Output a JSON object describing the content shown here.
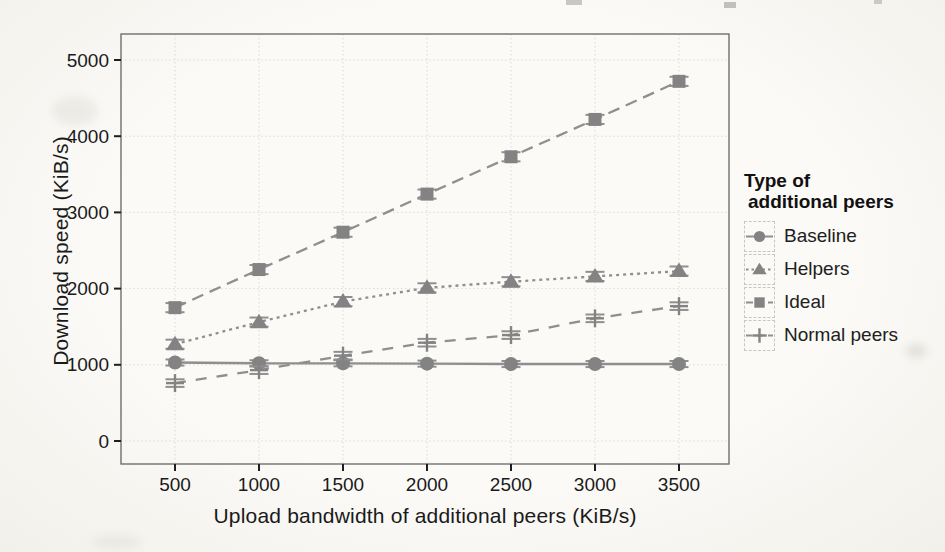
{
  "colors": {
    "paper": "#faf9f6",
    "series": "#8f8f8f",
    "marker": "#838383",
    "grid": "#dcdad4",
    "panel_border": "#6f6f6f",
    "tick": "#1f1f1f",
    "text": "#1a1a1a"
  },
  "chart_data": {
    "type": "line",
    "title": "",
    "xlabel": "Upload bandwidth of additional peers (KiB/s)",
    "ylabel": "Download speed (KiB/s)",
    "x": [
      500,
      1000,
      1500,
      2000,
      2500,
      3000,
      3500
    ],
    "xticks": [
      500,
      1000,
      1500,
      2000,
      2500,
      3000,
      3500
    ],
    "yticks": [
      0,
      1000,
      2000,
      3000,
      4000,
      5000
    ],
    "xlim": [
      180,
      3820
    ],
    "ylim": [
      -360,
      5340
    ],
    "grid": "dotted-major",
    "legend_position": "right",
    "legend_title": [
      "Type of",
      "additional peers"
    ],
    "series": [
      {
        "name": "Baseline",
        "marker": "circle",
        "linestyle": "solid",
        "values": [
          1030,
          1020,
          1020,
          1015,
          1010,
          1010,
          1010
        ],
        "error": 40
      },
      {
        "name": "Helpers",
        "marker": "triangle",
        "linestyle": "dotted",
        "values": [
          1270,
          1560,
          1830,
          2010,
          2090,
          2160,
          2230
        ],
        "error": 60
      },
      {
        "name": "Ideal",
        "marker": "square",
        "linestyle": "longdash",
        "values": [
          1750,
          2250,
          2740,
          3240,
          3730,
          4220,
          4720
        ],
        "error": 60
      },
      {
        "name": "Normal peers",
        "marker": "plus",
        "linestyle": "dash",
        "values": [
          760,
          930,
          1120,
          1290,
          1390,
          1610,
          1770
        ],
        "error": 50
      }
    ]
  }
}
